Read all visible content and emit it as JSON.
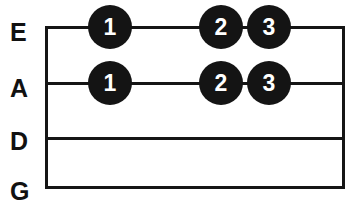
{
  "diagram": {
    "type": "guitar-chord-fretboard",
    "orientation": "horizontal",
    "strings": [
      {
        "name": "E",
        "label": "E",
        "y": 27
      },
      {
        "name": "A",
        "label": "A",
        "y": 83
      },
      {
        "name": "D",
        "label": "D",
        "y": 138
      },
      {
        "name": "G",
        "label": "G",
        "y": 189
      }
    ],
    "board": {
      "left": 45,
      "right": 345,
      "top": 26,
      "bottom": 189,
      "line_color": "#151515",
      "background": "#ffffff"
    },
    "finger_dots": [
      {
        "finger": "1",
        "string": "E",
        "x": 110,
        "y": 27
      },
      {
        "finger": "2",
        "string": "E",
        "x": 221,
        "y": 27
      },
      {
        "finger": "3",
        "string": "E",
        "x": 269,
        "y": 27
      },
      {
        "finger": "1",
        "string": "A",
        "x": 110,
        "y": 83
      },
      {
        "finger": "2",
        "string": "A",
        "x": 221,
        "y": 83
      },
      {
        "finger": "3",
        "string": "A",
        "x": 269,
        "y": 83
      }
    ],
    "colors": {
      "dot_fill": "#141414",
      "dot_text": "#ffffff",
      "line": "#151515",
      "label_text": "#111111"
    }
  }
}
